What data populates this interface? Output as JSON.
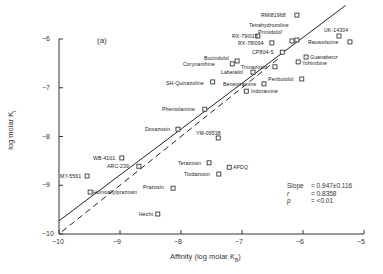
{
  "panel_label": "(a)",
  "chart_data": {
    "type": "scatter",
    "title": "",
    "xlabel": "Affinity (log molar K_B)",
    "ylabel": "log molar K_i",
    "xlim": [
      -10,
      -5
    ],
    "ylim": [
      -10,
      -6
    ],
    "x_ticks": [
      "-10",
      "-9",
      "-8",
      "-7",
      "-6",
      "-5"
    ],
    "y_ticks": [
      "-6",
      "-7",
      "-8",
      "-9",
      "-10"
    ],
    "grid": false,
    "legend": null,
    "marker": "open-square",
    "points": [
      {
        "label": "RMI81968",
        "x": -6.1,
        "y": -5.51
      },
      {
        "label": "Tetrahydrozoline",
        "x": -6.18,
        "y": -6.04
      },
      {
        "label": "Primidolol'",
        "x": -6.1,
        "y": -6.02
      },
      {
        "label": "UK-14304",
        "x": -5.41,
        "y": -5.94
      },
      {
        "label": "Rauwolscine",
        "x": -5.23,
        "y": -6.06
      },
      {
        "label": "RX-79I015",
        "x": -6.74,
        "y": -5.94
      },
      {
        "label": "RX-78I094",
        "x": -6.51,
        "y": -6.08
      },
      {
        "label": "CP804-S",
        "x": -6.34,
        "y": -6.27
      },
      {
        "label": "Guanabenz",
        "x": -5.95,
        "y": -6.37
      },
      {
        "label": "Yohimbine",
        "x": -6.08,
        "y": -6.47
      },
      {
        "label": "Bucindolol",
        "x": -7.08,
        "y": -6.45
      },
      {
        "label": "Corynanthine",
        "x": -7.16,
        "y": -6.51
      },
      {
        "label": "Trimazosin",
        "x": -6.46,
        "y": -6.57
      },
      {
        "label": "Labetalol",
        "x": -6.82,
        "y": -6.68
      },
      {
        "label": "SH-Quinazoline",
        "x": -7.48,
        "y": -6.88
      },
      {
        "label": "Benextramine",
        "x": -6.64,
        "y": -6.92
      },
      {
        "label": "Penbutolol",
        "x": -6.02,
        "y": -6.82
      },
      {
        "label": "Indoramine",
        "x": -6.93,
        "y": -7.07
      },
      {
        "label": "Phentolamine",
        "x": -7.61,
        "y": -7.44
      },
      {
        "label": "Doxazosin",
        "x": -8.05,
        "y": -7.85
      },
      {
        "label": "YM-09538",
        "x": -7.39,
        "y": -8.03
      },
      {
        "label": "WB-4101",
        "x": -8.97,
        "y": -8.44
      },
      {
        "label": "ARC-239",
        "x": -8.69,
        "y": -8.61
      },
      {
        "label": "MY-5561",
        "x": -9.54,
        "y": -8.81
      },
      {
        "label": "Terazosin",
        "x": -7.54,
        "y": -8.54
      },
      {
        "label": "APDQ",
        "x": -7.21,
        "y": -8.63
      },
      {
        "label": "Tiodazosin",
        "x": -7.38,
        "y": -8.77
      },
      {
        "label": "Prazosin",
        "x": -8.13,
        "y": -9.06
      },
      {
        "label": "Homoallylprazosin",
        "x": -9.49,
        "y": -9.14
      },
      {
        "label": "Hecht",
        "x": -8.38,
        "y": -9.59
      }
    ],
    "lines": [
      {
        "name": "regression",
        "style": "solid",
        "x": [
          -10,
          -5.3
        ],
        "y": [
          -9.73,
          -5.31
        ]
      },
      {
        "name": "identity",
        "style": "dashed",
        "x": [
          -9.95,
          -6.4
        ],
        "y": [
          -9.95,
          -6.4
        ]
      }
    ],
    "annotations": {
      "slope": "0.947±0.116",
      "r": "0.8358",
      "p": "<0.01"
    }
  },
  "stats": {
    "slope_key": "Slope",
    "slope_val": "= 0.947±0.116",
    "r_key": "r",
    "r_val": "= 0.8358",
    "p_key": "p",
    "p_val": "= <0.01"
  },
  "axes": {
    "xlabel": "Affinity   (log molar K",
    "xlabel_sub": "B",
    "xlabel_close": ")",
    "ylabel": "log molar K",
    "ylabel_sub": "i"
  },
  "labels": [
    {
      "text": "RMI81968",
      "x": 261,
      "y": 12
    },
    {
      "text": "Tetrahydrozoline",
      "x": 249,
      "y": 22
    },
    {
      "text": "Primidolol'",
      "x": 258,
      "y": 29
    },
    {
      "text": "UK-14304",
      "x": 324,
      "y": 27
    },
    {
      "text": "Rauwolscine",
      "x": 308,
      "y": 39
    },
    {
      "text": "RX-79I015",
      "x": 232,
      "y": 33
    },
    {
      "text": "RX-78I094",
      "x": 238,
      "y": 40
    },
    {
      "text": "CP804-S",
      "x": 252,
      "y": 49
    },
    {
      "text": "Guanabenz",
      "x": 310,
      "y": 54
    },
    {
      "text": "Yohimbine",
      "x": 302,
      "y": 60
    },
    {
      "text": "Bucindolol",
      "x": 204,
      "y": 55
    },
    {
      "text": "Corynanthine",
      "x": 183,
      "y": 61
    },
    {
      "text": "Trimazosin",
      "x": 241,
      "y": 64
    },
    {
      "text": "Labetalol",
      "x": 221,
      "y": 69
    },
    {
      "text": "SH-Quinazoline",
      "x": 166,
      "y": 80
    },
    {
      "text": "Benextramine",
      "x": 223,
      "y": 81
    },
    {
      "text": "Penbutolol",
      "x": 268,
      "y": 76
    },
    {
      "text": "Indoramine",
      "x": 251,
      "y": 88
    },
    {
      "text": "Phentolamine",
      "x": 162,
      "y": 106
    },
    {
      "text": "Doxazosin",
      "x": 145,
      "y": 126
    },
    {
      "text": "YM-09538",
      "x": 196,
      "y": 130
    },
    {
      "text": "WB-4101",
      "x": 93,
      "y": 155
    },
    {
      "text": "ARC-239",
      "x": 107,
      "y": 163
    },
    {
      "text": "MY-5561",
      "x": 60,
      "y": 173
    },
    {
      "text": "Terazosin",
      "x": 178,
      "y": 160
    },
    {
      "text": "APDQ",
      "x": 233,
      "y": 164
    },
    {
      "text": "Tiodazosin",
      "x": 184,
      "y": 171
    },
    {
      "text": "Prazosin",
      "x": 143,
      "y": 184
    },
    {
      "text": "Homoallylprazosin",
      "x": 93,
      "y": 189
    },
    {
      "text": "Hecht",
      "x": 139,
      "y": 211
    }
  ]
}
